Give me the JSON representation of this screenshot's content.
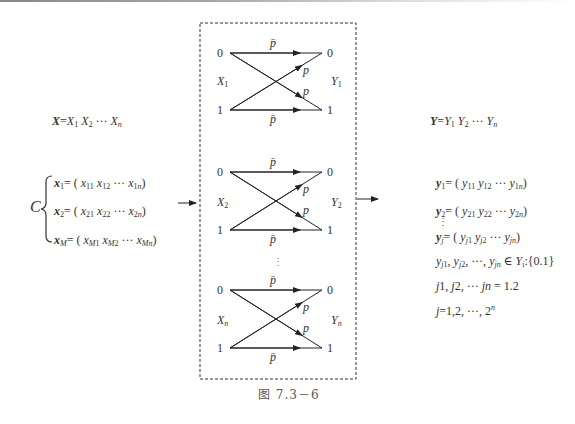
{
  "left": {
    "source_seq": {
      "bold": "X",
      "rest": "=X",
      "parts": [
        "X₁",
        "X₂",
        "···",
        "Xₙ"
      ]
    },
    "brace_label": "C",
    "codewords": [
      {
        "name": "x",
        "idx": "1",
        "elems": [
          "x",
          "11",
          "x",
          "12",
          "···",
          "x",
          "1n"
        ]
      },
      {
        "name": "x",
        "idx": "2",
        "elems": [
          "x",
          "21",
          "x",
          "22",
          "···",
          "x",
          "2n"
        ]
      },
      {
        "name": "x",
        "idx": "M",
        "elems": [
          "x",
          "M1",
          "x",
          "M2",
          "···",
          "x",
          "Mn"
        ]
      }
    ]
  },
  "channels": [
    {
      "in_label": "X",
      "in_sub": "1",
      "out_label": "Y",
      "out_sub": "1",
      "top_in": "0",
      "bot_in": "1",
      "top_out": "0",
      "bot_out": "1",
      "top_prob": "p̄",
      "bot_prob": "p̄",
      "cross_up": "p",
      "cross_down": "p"
    },
    {
      "in_label": "X",
      "in_sub": "2",
      "out_label": "Y",
      "out_sub": "2",
      "top_in": "0",
      "bot_in": "1",
      "top_out": "0",
      "bot_out": "1",
      "top_prob": "p̄",
      "bot_prob": "p̄",
      "cross_up": "p",
      "cross_down": "p"
    },
    {
      "in_label": "X",
      "in_sub": "n",
      "out_label": "Y",
      "out_sub": "n",
      "top_in": "0",
      "bot_in": "1",
      "top_out": "0",
      "bot_out": "1",
      "top_prob": "p̄",
      "bot_prob": "p̄",
      "cross_up": "p",
      "cross_down": "p"
    }
  ],
  "vdots": "⋮",
  "right": {
    "output_seq": "Y=Y₁ Y₂ ··· Yₙ",
    "y1": "= ( y₁₁ y₁₂ ··· y₁ₙ )",
    "y2": "= ( y₂₁ y₂₂ ··· y₂ₙ )",
    "yj": "= ( y_j1 y_j2 ··· y_jn )",
    "membership": "y_j1, y_j2, ···, y_jn ∈ Yᵢ {0.1}",
    "j_index": "j1, j2, ··· jn = 1.2",
    "j_range": "j=1,2, ···, 2ⁿ"
  },
  "caption": "图 7.3－6"
}
